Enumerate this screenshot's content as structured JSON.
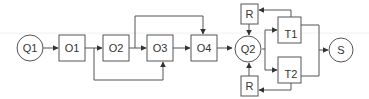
{
  "diagram": {
    "type": "flow-network",
    "nodes": [
      {
        "id": "Q1",
        "label": "Q1",
        "shape": "circle"
      },
      {
        "id": "O1",
        "label": "O1",
        "shape": "box"
      },
      {
        "id": "O2",
        "label": "O2",
        "shape": "box"
      },
      {
        "id": "O3",
        "label": "O3",
        "shape": "box"
      },
      {
        "id": "O4",
        "label": "O4",
        "shape": "box"
      },
      {
        "id": "Q2",
        "label": "Q2",
        "shape": "circle"
      },
      {
        "id": "R_top",
        "label": "R",
        "shape": "box"
      },
      {
        "id": "R_bottom",
        "label": "R",
        "shape": "box"
      },
      {
        "id": "T1",
        "label": "T1",
        "shape": "box"
      },
      {
        "id": "T2",
        "label": "T2",
        "shape": "box"
      },
      {
        "id": "S",
        "label": "S",
        "shape": "circle"
      }
    ],
    "edges": [
      {
        "from": "Q1",
        "to": "O1"
      },
      {
        "from": "O1",
        "to": "O2"
      },
      {
        "from": "O1",
        "to": "O3",
        "note": "bypass below O2"
      },
      {
        "from": "O2",
        "to": "O3"
      },
      {
        "from": "O2",
        "to": "O4",
        "note": "bypass above O3"
      },
      {
        "from": "O3",
        "to": "O4"
      },
      {
        "from": "O4",
        "to": "Q2"
      },
      {
        "from": "R_top",
        "to": "Q2"
      },
      {
        "from": "R_bottom",
        "to": "Q2"
      },
      {
        "from": "Q2",
        "to": "T1"
      },
      {
        "from": "Q2",
        "to": "T2"
      },
      {
        "from": "T1",
        "to": "R_top"
      },
      {
        "from": "T2",
        "to": "R_bottom"
      },
      {
        "from": "T1",
        "to": "S"
      },
      {
        "from": "T2",
        "to": "S"
      }
    ],
    "colors": {
      "stroke": "#555555",
      "text": "#333333",
      "background": "#ffffff"
    }
  }
}
